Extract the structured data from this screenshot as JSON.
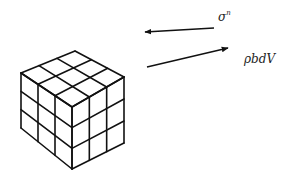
{
  "diagram": {
    "type": "free-body-element",
    "colors": {
      "stroke": "#111111",
      "text": "#222222",
      "background": "#ffffff"
    },
    "cube": {
      "description": "3x3x3 grid cube (volume element)",
      "divisions": 3,
      "vertices": {
        "top": [
          75,
          51
        ],
        "left": [
          21,
          73
        ],
        "right": [
          124,
          77
        ],
        "front": [
          72,
          107
        ],
        "bottom_left": [
          21,
          128
        ],
        "bottom_right": [
          124,
          143
        ],
        "bottom": [
          72,
          169
        ]
      }
    },
    "arrows": [
      {
        "id": "surface-traction",
        "from": [
          214,
          28
        ],
        "to": [
          145,
          32
        ],
        "label_base": "σ",
        "label_sup": "n"
      },
      {
        "id": "body-force",
        "from": [
          147,
          67
        ],
        "to": [
          228,
          48
        ],
        "label": "ρbdV"
      }
    ]
  },
  "labels": {
    "sigma_base": "σ",
    "sigma_sup": "n",
    "body_force": "ρbdV"
  }
}
